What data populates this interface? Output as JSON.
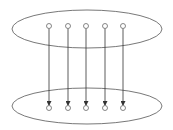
{
  "diagram": {
    "type": "mapping",
    "colors": {
      "stroke": "#555555",
      "background": "#ffffff"
    },
    "sets": [
      {
        "id": "top",
        "cx": 87,
        "cy": 29,
        "rx": 75,
        "ry": 19
      },
      {
        "id": "bottom",
        "cx": 87,
        "cy": 106,
        "rx": 75,
        "ry": 18
      }
    ],
    "top_nodes_x": [
      49,
      68,
      86,
      105,
      123
    ],
    "top_nodes_y": 26,
    "bottom_nodes_y": 108,
    "arrow_count": 5
  }
}
